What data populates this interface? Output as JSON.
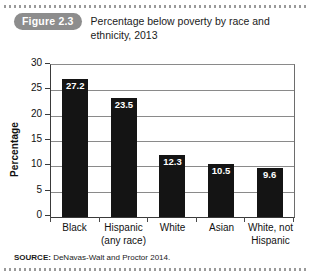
{
  "figure": {
    "badge_label": "Figure 2.3",
    "title": "Percentage below poverty by race and ethnicity, 2013",
    "source_key": "SOURCE:",
    "source_text": "DeNavas-Walt and Proctor 2014."
  },
  "colors": {
    "badge_background": "#8d8d8d",
    "badge_text": "#ffffff",
    "bar_fill": "#141414",
    "bar_value_text": "#ffffff",
    "gridline": "#8a8a8a",
    "axis": "#3a3a3a",
    "page_background": "#ffffff",
    "dotted_rule": "#9a9a9a"
  },
  "chart_data": {
    "type": "bar",
    "title": "Percentage below poverty by race and ethnicity, 2013",
    "xlabel": "",
    "ylabel": "Percentage",
    "categories": [
      "Black",
      "Hispanic (any race)",
      "White",
      "Asian",
      "White, not Hispanic"
    ],
    "category_lines": [
      [
        "Black"
      ],
      [
        "Hispanic",
        "(any race)"
      ],
      [
        "White"
      ],
      [
        "Asian"
      ],
      [
        "White, not",
        "Hispanic"
      ]
    ],
    "values": [
      27.2,
      23.5,
      12.3,
      10.5,
      9.6
    ],
    "value_labels": [
      "27.2",
      "23.5",
      "12.3",
      "10.5",
      "9.6"
    ],
    "ylim": [
      0,
      30
    ],
    "yticks": [
      0,
      5,
      10,
      15,
      20,
      25,
      30
    ],
    "ytick_labels": [
      "0",
      "5",
      "10",
      "15",
      "20",
      "25",
      "30"
    ],
    "grid": true,
    "legend": "none"
  }
}
